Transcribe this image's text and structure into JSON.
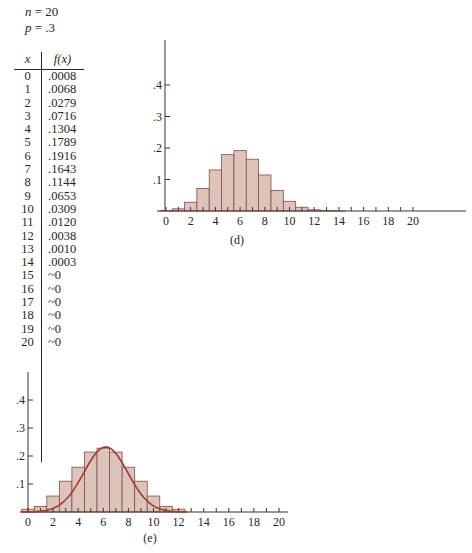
{
  "params": {
    "n_label": "n",
    "n_value": "= 20",
    "p_label": "p",
    "p_value": "= .3"
  },
  "table": {
    "headers": [
      "x",
      "f(x)"
    ],
    "rows": [
      [
        "0",
        ".0008"
      ],
      [
        "1",
        ".0068"
      ],
      [
        "2",
        ".0279"
      ],
      [
        "3",
        ".0716"
      ],
      [
        "4",
        ".1304"
      ],
      [
        "5",
        ".1789"
      ],
      [
        "6",
        ".1916"
      ],
      [
        "7",
        ".1643"
      ],
      [
        "8",
        ".1144"
      ],
      [
        "9",
        ".0653"
      ],
      [
        "10",
        ".0309"
      ],
      [
        "11",
        ".0120"
      ],
      [
        "12",
        ".0038"
      ],
      [
        "13",
        ".0010"
      ],
      [
        "14",
        ".0003"
      ],
      [
        "15",
        "~0"
      ],
      [
        "16",
        "~0"
      ],
      [
        "17",
        "~0"
      ],
      [
        "18",
        "~0"
      ],
      [
        "19",
        "~0"
      ],
      [
        "20",
        "~0"
      ]
    ]
  },
  "colors": {
    "bar_fill": "#dcc4bd",
    "bar_stroke": "#8a4a40",
    "axis": "#3a3330",
    "curve": "#9a3d2e"
  },
  "chart_data": [
    {
      "type": "bar",
      "title": "Binomial distribution n = 20, p = .3",
      "caption": "(d)",
      "categories": [
        0,
        1,
        2,
        3,
        4,
        5,
        6,
        7,
        8,
        9,
        10,
        11,
        12,
        13,
        14,
        15,
        16,
        17,
        18,
        19,
        20
      ],
      "values": [
        0.0008,
        0.0068,
        0.0279,
        0.0716,
        0.1304,
        0.1789,
        0.1916,
        0.1643,
        0.1144,
        0.0653,
        0.0309,
        0.012,
        0.0038,
        0.001,
        0.0003,
        0,
        0,
        0,
        0,
        0,
        0
      ],
      "x_tick_labels": [
        "0",
        "2",
        "4",
        "6",
        "8",
        "10",
        "12",
        "14",
        "16",
        "18",
        "20"
      ],
      "y_tick_labels": [
        ".1",
        ".2",
        ".3",
        ".4"
      ],
      "ylim": [
        0,
        0.45
      ],
      "xlabel": "",
      "ylabel": "",
      "grid": false,
      "legend": "none"
    },
    {
      "type": "bar",
      "title": "Normal approximation to binomial",
      "caption": "(e)",
      "categories": [
        0,
        1,
        2,
        3,
        4,
        5,
        6,
        7,
        8,
        9,
        10,
        11,
        12,
        13,
        14,
        15,
        16,
        17,
        18,
        19,
        20
      ],
      "values": [
        0.01,
        0.02,
        0.057,
        0.11,
        0.16,
        0.214,
        0.228,
        0.214,
        0.16,
        0.11,
        0.057,
        0.02,
        0.01,
        0,
        0,
        0,
        0,
        0,
        0,
        0,
        0
      ],
      "overlay_curve": {
        "type": "normal",
        "mean": 6.2,
        "sd": 1.75,
        "peak": 0.232
      },
      "x_tick_labels": [
        "0",
        "2",
        "4",
        "6",
        "8",
        "10",
        "12",
        "14",
        "16",
        "18",
        "20"
      ],
      "y_tick_labels": [
        ".1",
        ".2",
        ".3",
        ".4"
      ],
      "ylim": [
        0,
        0.45
      ],
      "xlabel": "",
      "ylabel": "",
      "grid": false,
      "legend": "none"
    }
  ]
}
